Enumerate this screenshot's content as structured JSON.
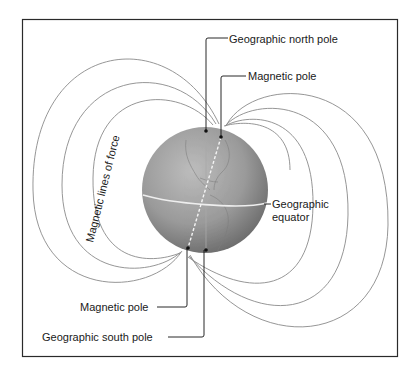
{
  "diagram": {
    "labels": {
      "geographic_north_pole": "Geographic north pole",
      "magnetic_pole_north": "Magnetic pole",
      "geographic_equator_line1": "Geographic",
      "geographic_equator_line2": "equator",
      "magnetic_lines_of_force": "Magnetic lines of force",
      "magnetic_pole_south": "Magnetic pole",
      "geographic_south_pole": "Geographic south pole"
    },
    "colors": {
      "frame": "#2a2a2a",
      "field_line": "#8a8a8a",
      "globe_light": "#b4b4b4",
      "globe_dark": "#6e6e6e",
      "equator": "#eeeeee",
      "axis_dash": "#f2f2f2",
      "leader": "#111111"
    }
  }
}
